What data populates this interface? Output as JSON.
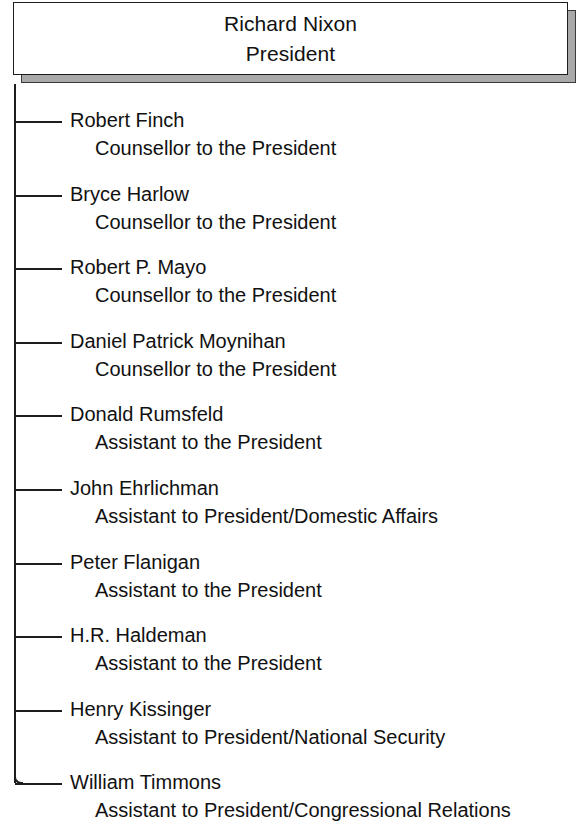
{
  "chart_data": {
    "type": "diagram",
    "diagram_type": "organization-chart",
    "root": {
      "name": "Richard Nixon",
      "title": "President"
    },
    "children": [
      {
        "name": "Robert Finch",
        "title": "Counsellor to the President"
      },
      {
        "name": "Bryce Harlow",
        "title": "Counsellor to the President"
      },
      {
        "name": "Robert P. Mayo",
        "title": "Counsellor to the President"
      },
      {
        "name": "Daniel Patrick Moynihan",
        "title": "Counsellor to the President"
      },
      {
        "name": "Donald Rumsfeld",
        "title": "Assistant to the President"
      },
      {
        "name": "John Ehrlichman",
        "title": "Assistant to President/Domestic Affairs"
      },
      {
        "name": "Peter Flanigan",
        "title": "Assistant to the President"
      },
      {
        "name": "H.R. Haldeman",
        "title": "Assistant to the President"
      },
      {
        "name": "Henry Kissinger",
        "title": "Assistant to President/National Security"
      },
      {
        "name": "William Timmons",
        "title": "Assistant to President/Congressional Relations"
      }
    ],
    "colors": {
      "text": "#111111",
      "line": "#1d1d1d",
      "box_fill": "#ffffff",
      "box_shadow": "#a9a9a9",
      "background": "#ffffff"
    }
  }
}
